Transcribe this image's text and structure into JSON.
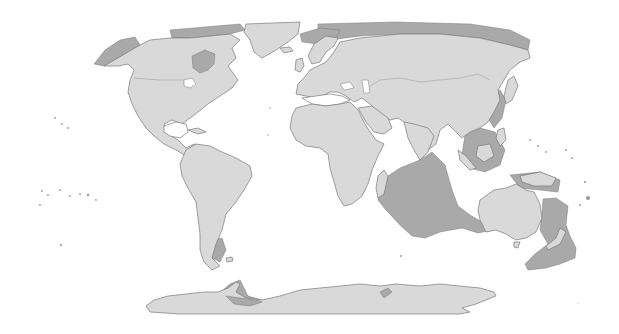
{
  "map": {
    "type": "world-map",
    "projection": "pseudo-cylindrical (equal-earth-like)",
    "colors": {
      "background": "#ffffff",
      "land": "#d9d9d9",
      "shelf": "#a9a9a9",
      "coast": "#7a7a7a"
    },
    "regions": [
      {
        "name": "North America",
        "style": "land"
      },
      {
        "name": "Greenland",
        "style": "land"
      },
      {
        "name": "South America",
        "style": "land"
      },
      {
        "name": "Europe",
        "style": "land"
      },
      {
        "name": "Africa",
        "style": "land"
      },
      {
        "name": "Asia",
        "style": "land"
      },
      {
        "name": "Australia",
        "style": "land"
      },
      {
        "name": "Antarctica",
        "style": "land"
      },
      {
        "name": "Indian Ocean plateau",
        "style": "shelf"
      },
      {
        "name": "Zealandia",
        "style": "shelf"
      },
      {
        "name": "Siberian shelf",
        "style": "shelf"
      },
      {
        "name": "Sunda shelf",
        "style": "shelf"
      },
      {
        "name": "Hudson Bay",
        "style": "shelf"
      },
      {
        "name": "Bering shelf",
        "style": "shelf"
      },
      {
        "name": "Patagonian shelf",
        "style": "shelf"
      }
    ]
  }
}
